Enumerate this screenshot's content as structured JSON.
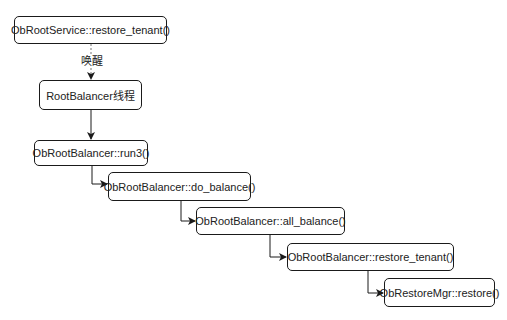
{
  "diagram": {
    "nodes": [
      {
        "id": "n1",
        "label": "ObRootService::restore_tenant()"
      },
      {
        "id": "n2",
        "label": "RootBalancer线程"
      },
      {
        "id": "n3",
        "label": "ObRootBalancer::run3()"
      },
      {
        "id": "n4",
        "label": "ObRootBalancer::do_balance()"
      },
      {
        "id": "n5",
        "label": "ObRootBalancer::all_balance()"
      },
      {
        "id": "n6",
        "label": "ObRootBalancer::restore_tenant()"
      },
      {
        "id": "n7",
        "label": "ObRestoreMgr::restore()"
      }
    ],
    "edges": [
      {
        "from": "n1",
        "to": "n2",
        "style": "dashed",
        "label": "唤醒"
      },
      {
        "from": "n2",
        "to": "n3",
        "style": "solid"
      },
      {
        "from": "n3",
        "to": "n4",
        "style": "solid"
      },
      {
        "from": "n4",
        "to": "n5",
        "style": "solid"
      },
      {
        "from": "n5",
        "to": "n6",
        "style": "solid"
      },
      {
        "from": "n6",
        "to": "n7",
        "style": "solid"
      }
    ],
    "colors": {
      "stroke": "#1a1a1a",
      "dashed_stroke": "#777777",
      "fill": "#ffffff",
      "text": "#222222"
    }
  }
}
